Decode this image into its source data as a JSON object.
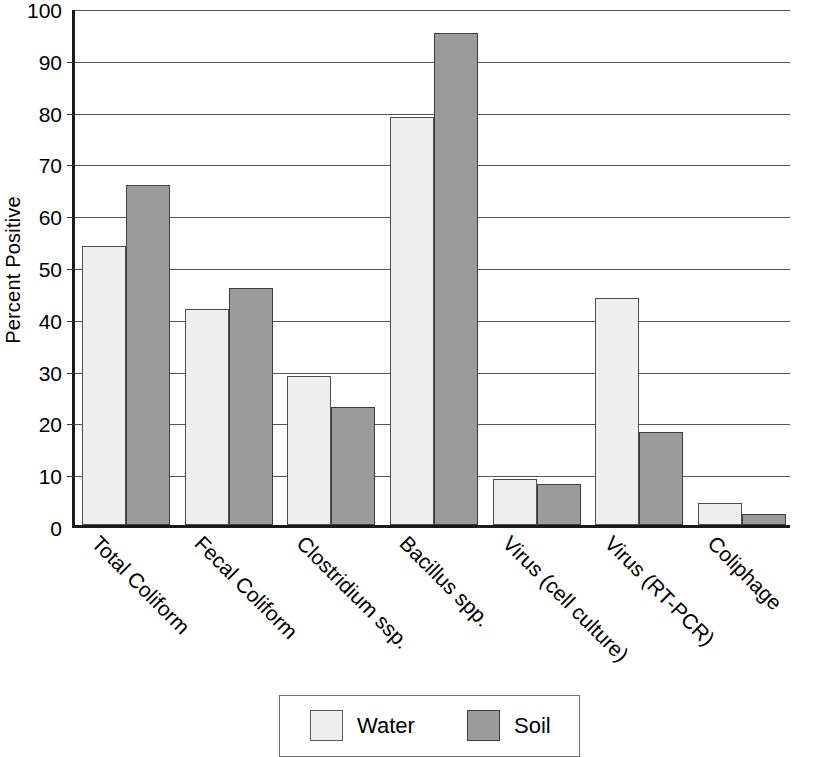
{
  "chart_data": {
    "type": "bar",
    "title": "",
    "subtitle": "",
    "xlabel": "",
    "ylabel": "Percent Positive",
    "ylim": [
      0,
      100
    ],
    "ytick_interval": 10,
    "yticks": [
      "100",
      "90",
      "80",
      "70",
      "60",
      "50",
      "40",
      "30",
      "20",
      "10",
      "0"
    ],
    "grid": "horizontal",
    "legend_position": "bottom-center",
    "categories": [
      "Total Coliform",
      "Fecal Coliform",
      "Clostridium ssp.",
      "Bacillus spp.",
      "Virus (cell culture)",
      "Virus (RT-PCR)",
      "Coliphage"
    ],
    "series": [
      {
        "name": "Water",
        "color": "#efefef",
        "values": [
          53.8,
          41.7,
          28.7,
          78.8,
          8.9,
          43.8,
          4.3
        ]
      },
      {
        "name": "Soil",
        "color": "#9b9b9b",
        "values": [
          65.6,
          45.7,
          22.7,
          94.9,
          8.0,
          18.0,
          2.1
        ]
      }
    ]
  },
  "legend": {
    "entries": [
      {
        "label": "Water"
      },
      {
        "label": "Soil"
      }
    ]
  }
}
